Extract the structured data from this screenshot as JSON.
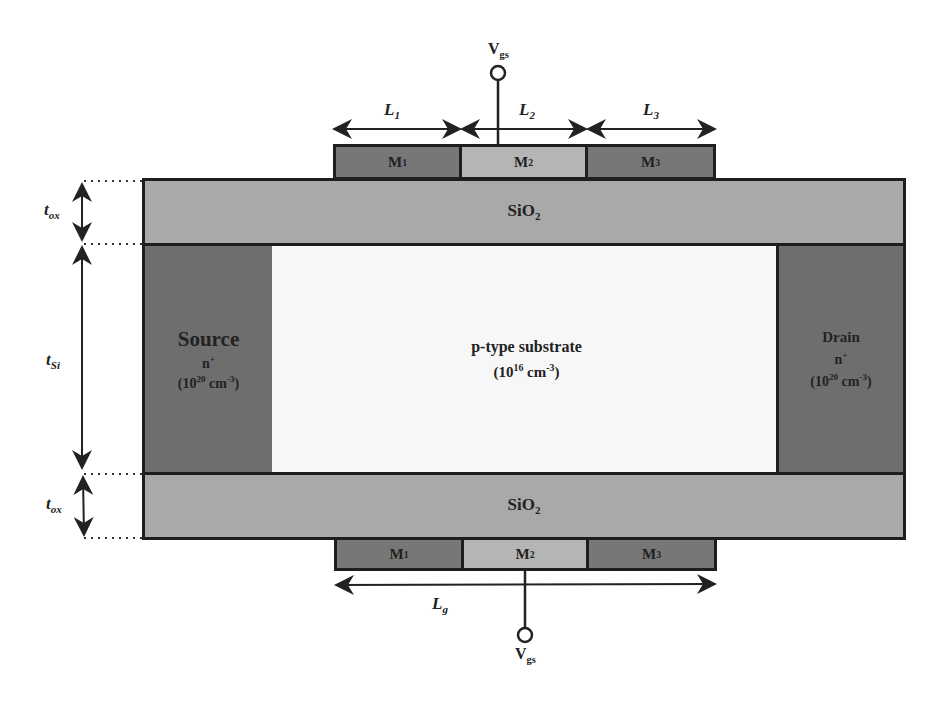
{
  "diagram": {
    "top_gate": {
      "terminal_label": "V",
      "terminal_sub": "gs",
      "segments": [
        {
          "id": "M1",
          "label": "M",
          "sub": "1",
          "length_label": "L",
          "length_sub": "1"
        },
        {
          "id": "M2",
          "label": "M",
          "sub": "2",
          "length_label": "L",
          "length_sub": "2"
        },
        {
          "id": "M3",
          "label": "M",
          "sub": "3",
          "length_label": "L",
          "length_sub": "3"
        }
      ]
    },
    "bottom_gate": {
      "terminal_label": "V",
      "terminal_sub": "gs",
      "total_length_label": "L",
      "total_length_sub": "g",
      "segments": [
        {
          "id": "M1",
          "label": "M",
          "sub": "1"
        },
        {
          "id": "M2",
          "label": "M",
          "sub": "2"
        },
        {
          "id": "M3",
          "label": "M",
          "sub": "3"
        }
      ]
    },
    "top_oxide": {
      "label": "SiO",
      "sub": "2"
    },
    "bottom_oxide": {
      "label": "SiO",
      "sub": "2"
    },
    "source": {
      "title": "Source",
      "type": "n",
      "type_sup": "+",
      "doping_base": "(10",
      "doping_exp": "20",
      "doping_unit": " cm",
      "doping_unit_exp": "-3",
      "close": ")"
    },
    "drain": {
      "title": "Drain",
      "type": "n",
      "type_sup": "+",
      "doping_base": "(10",
      "doping_exp": "20",
      "doping_unit": " cm",
      "doping_unit_exp": "-3",
      "close": ")"
    },
    "substrate": {
      "title": "p-type substrate",
      "doping_base": "(10",
      "doping_exp": "16",
      "doping_unit": " cm",
      "doping_unit_exp": "-3",
      "close": ")"
    },
    "dimensions": {
      "t_ox_top": {
        "label": "t",
        "sub": "ox"
      },
      "t_si": {
        "label": "t",
        "sub": "Si"
      },
      "t_ox_bottom": {
        "label": "t",
        "sub": "ox"
      }
    },
    "colors": {
      "oxide": "#a9a9a9",
      "doped": "#6e6e6e",
      "substrate": "#f7f7f7",
      "metal_dark": "#777777",
      "metal_light": "#b5b5b5",
      "outline": "#1e1e1e"
    }
  }
}
